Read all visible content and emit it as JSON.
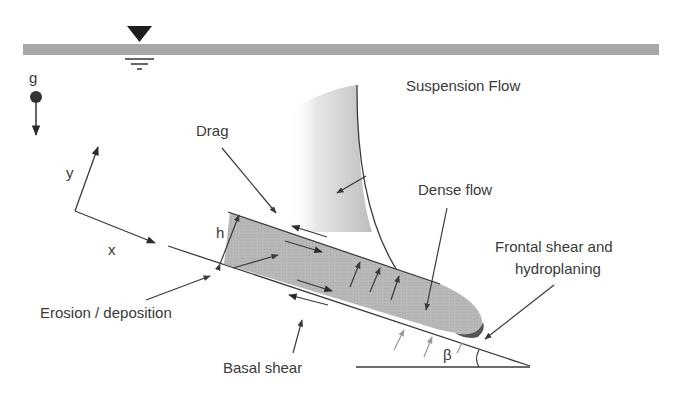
{
  "diagram": {
    "labels": {
      "gravity": "g",
      "suspension_flow": "Suspension Flow",
      "drag": "Drag",
      "dense_flow": "Dense flow",
      "frontal_shear_line1": "Frontal shear and",
      "frontal_shear_line2": "hydroplaning",
      "erosion_deposition": "Erosion / deposition",
      "basal_shear": "Basal shear",
      "axis_x": "x",
      "axis_y": "y",
      "height": "h",
      "slope_angle": "β"
    },
    "colors": {
      "water_surface": "#a8a8a8",
      "dense_flow_fill": "#b4b4b4",
      "front_dark": "#555555",
      "line": "#3a3a3a",
      "suspension_gradient_dark": "#bdbdbd"
    }
  }
}
